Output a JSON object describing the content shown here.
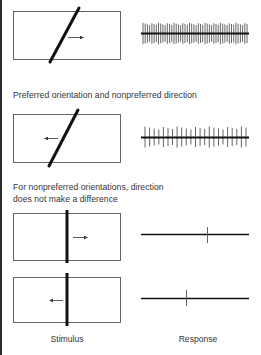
{
  "figure": {
    "captions": {
      "preferred_nonpreferred": "Preferred orientation and  nonpreferred direction",
      "nonpreferred_line1": "For nonpreferred orientations, direction",
      "nonpreferred_line2": "does not make a difference"
    },
    "column_labels": {
      "stimulus": "Stimulus",
      "response": "Response"
    },
    "rows": [
      {
        "stimulus": {
          "bar": "diagonal",
          "arrow": "right-icon"
        },
        "response": {
          "pattern": "dense-spike-train",
          "spike_count": 48
        }
      },
      {
        "stimulus": {
          "bar": "diagonal",
          "arrow": "left-icon"
        },
        "response": {
          "pattern": "moderate-spike-train",
          "spike_count": 23
        }
      },
      {
        "stimulus": {
          "bar": "vertical",
          "arrow": "right-icon"
        },
        "response": {
          "pattern": "single-spike",
          "spike_count": 1
        }
      },
      {
        "stimulus": {
          "bar": "vertical",
          "arrow": "left-icon"
        },
        "response": {
          "pattern": "single-spike",
          "spike_count": 1
        }
      }
    ],
    "colors": {
      "ink": "#1a1a1a",
      "box_outline": "#555555",
      "spike": "#444444"
    }
  }
}
